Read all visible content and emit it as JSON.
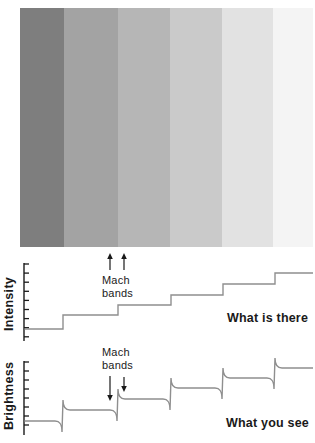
{
  "background": "#ffffff",
  "ink": "#1a1a1a",
  "curve_color": "#8f8f8f",
  "bands": {
    "description": "grayscale-step-gradient",
    "segments": [
      {
        "name": "band-1",
        "color": "#7e7e7e",
        "width": 44
      },
      {
        "name": "band-2",
        "color": "#a3a3a3",
        "width": 54
      },
      {
        "name": "band-3",
        "color": "#b6b6b6",
        "width": 52
      },
      {
        "name": "band-4",
        "color": "#cacaca",
        "width": 52
      },
      {
        "name": "band-5",
        "color": "#e2e2e2",
        "width": 51
      },
      {
        "name": "band-6",
        "color": "#f4f4f4",
        "width": 40
      }
    ]
  },
  "intensity_plot": {
    "ylabel": "Intensity",
    "annotation": "Mach bands",
    "caption": "What is there",
    "style": "staircase",
    "axis_x": 24,
    "axis_top": 263,
    "axis_bottom": 341,
    "tick_top": 264,
    "tick_gap": 9.1,
    "tick_count": 9,
    "tick_len": 5,
    "levels_y": [
      329,
      315,
      305,
      295,
      284,
      273
    ],
    "step_x": [
      63,
      118,
      171,
      223,
      275
    ],
    "end_x": 313,
    "arrows": [
      {
        "x": 110,
        "y_tail": 270,
        "y_head": 253
      },
      {
        "x": 124,
        "y_tail": 270,
        "y_head": 253
      }
    ]
  },
  "brightness_plot": {
    "ylabel": "Brightness",
    "annotation": "Mach bands",
    "caption": "What you see",
    "style": "mach",
    "axis_x": 24,
    "axis_top": 361,
    "axis_bottom": 435,
    "tick_top": 362,
    "tick_gap": 9,
    "tick_count": 8,
    "tick_len": 5,
    "levels_y": [
      421,
      410,
      399,
      388,
      378,
      368
    ],
    "step_x": [
      63,
      118,
      171,
      223,
      275
    ],
    "end_x": 313,
    "undershoot": 11,
    "overshoot": 10,
    "arrows": [
      {
        "x": 110,
        "y_tail": 376,
        "y_head": 401
      },
      {
        "x": 124,
        "y_tail": 377,
        "y_head": 392
      }
    ]
  }
}
